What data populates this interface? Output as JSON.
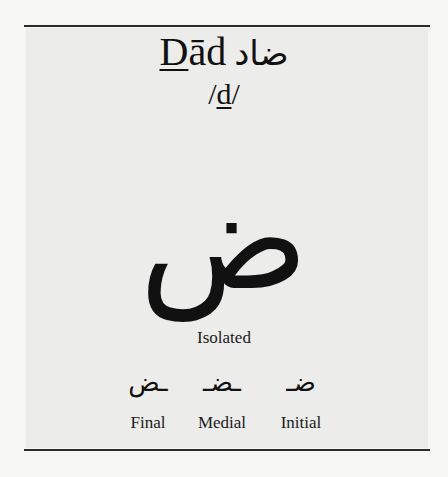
{
  "letter": {
    "name_underlined": "D",
    "name_rest": "ād",
    "name_arabic": "ضاد",
    "ipa_open": "/",
    "ipa_underlined": "d",
    "ipa_close": "/",
    "isolated_glyph": "ض",
    "isolated_label": "Isolated"
  },
  "forms": [
    {
      "glyph": "ـض",
      "label": "Final"
    },
    {
      "glyph": "ـضـ",
      "label": "Medial"
    },
    {
      "glyph": "ضـ",
      "label": "Initial"
    }
  ]
}
